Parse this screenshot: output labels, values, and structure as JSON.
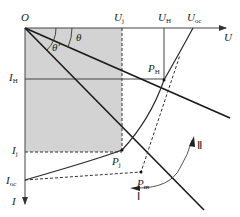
{
  "diagram": {
    "type": "I-U characteristic / operating point construction",
    "colors": {
      "axis": "#444444",
      "line": "#1a1a1a",
      "shade": "#d3d3d3",
      "curve": "#2a2a2a",
      "dashed": "#333333",
      "arc": "#555555"
    },
    "labels": {
      "origin": "O",
      "u_axis": "U",
      "i_axis": "I",
      "u_j_main": "U",
      "u_j_sub": "j",
      "u_h_main": "U",
      "u_h_sub": "H",
      "u_oc_main": "U",
      "u_oc_sub": "oc",
      "i_h_main": "I",
      "i_h_sub": "H",
      "i_j_main": "I",
      "i_j_sub": "j",
      "i_oc_main": "I",
      "i_oc_sub": "oc",
      "theta": "θ",
      "theta_prime": "θ'",
      "p_h_main": "P",
      "p_h_sub": "H",
      "p_j_main": "P",
      "p_j_sub": "j",
      "p_m_main": "P",
      "p_m_sub": "m",
      "region_1": "Ⅰ",
      "region_2": "Ⅱ"
    }
  }
}
